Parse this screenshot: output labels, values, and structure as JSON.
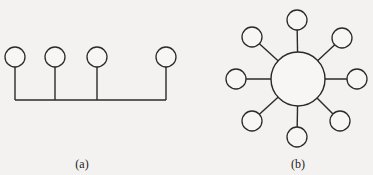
{
  "colors": {
    "background": "#f3f2f0",
    "stroke": "#2a2a2a",
    "node_fill": "#f7f6f4"
  },
  "diagrams": [
    {
      "id": "bus",
      "label": "(a)",
      "label_pos": [
        82,
        157
      ],
      "bus_line": {
        "y": 100,
        "x1": 15,
        "x2": 166
      },
      "node_radius": 10,
      "nodes": [
        {
          "x": 15,
          "y": 57
        },
        {
          "x": 55,
          "y": 57
        },
        {
          "x": 97,
          "y": 57
        },
        {
          "x": 166,
          "y": 57
        }
      ]
    },
    {
      "id": "star",
      "label": "(b)",
      "label_pos": [
        298,
        157
      ],
      "hub": {
        "x": 298,
        "y": 79,
        "r": 27
      },
      "node_radius": 10,
      "nodes": [
        {
          "x": 297,
          "y": 20
        },
        {
          "x": 342,
          "y": 38
        },
        {
          "x": 357,
          "y": 79
        },
        {
          "x": 340,
          "y": 121
        },
        {
          "x": 297,
          "y": 137
        },
        {
          "x": 252,
          "y": 121
        },
        {
          "x": 236,
          "y": 79
        },
        {
          "x": 252,
          "y": 37
        }
      ]
    }
  ]
}
